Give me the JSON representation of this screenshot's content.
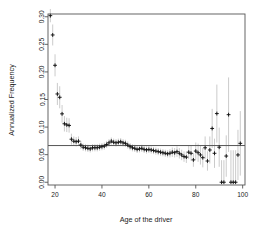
{
  "chart_data": {
    "type": "scatter",
    "title": "",
    "xlabel": "Age of the driver",
    "ylabel": "Annualized Frequency",
    "xlim": [
      17,
      101
    ],
    "ylim": [
      -0.005,
      0.305
    ],
    "xticks": [
      20,
      40,
      60,
      80,
      100
    ],
    "xtick_labels": [
      "20",
      "40",
      "60",
      "80",
      "100"
    ],
    "yticks": [
      0.0,
      0.05,
      0.1,
      0.15,
      0.2,
      0.25,
      0.3
    ],
    "ytick_labels": [
      "0.00",
      "0.05",
      "0.10",
      "0.15",
      "0.20",
      "0.25",
      "0.30"
    ],
    "grid": false,
    "legend": null,
    "marker": "plus",
    "marker_color": "#111111",
    "errorbar_color": "#b4b4b4",
    "reference_line": {
      "orientation": "horizontal",
      "y": 0.0665,
      "color": "#555555",
      "label": "overall mean annualized frequency"
    },
    "x": [
      18,
      19,
      20,
      21,
      22,
      23,
      24,
      25,
      26,
      27,
      28,
      29,
      30,
      31,
      32,
      33,
      34,
      35,
      36,
      37,
      38,
      39,
      40,
      41,
      42,
      43,
      44,
      45,
      46,
      47,
      48,
      49,
      50,
      51,
      52,
      53,
      54,
      55,
      56,
      57,
      58,
      59,
      60,
      61,
      62,
      63,
      64,
      65,
      66,
      67,
      68,
      69,
      70,
      71,
      72,
      73,
      74,
      75,
      76,
      77,
      78,
      79,
      80,
      81,
      82,
      83,
      84,
      85,
      86,
      87,
      88,
      89,
      90,
      91,
      92,
      93,
      94,
      95,
      96,
      97,
      98,
      99
    ],
    "y": [
      0.302,
      0.267,
      0.212,
      0.16,
      0.154,
      0.124,
      0.106,
      0.104,
      0.103,
      0.078,
      0.0745,
      0.0735,
      0.0745,
      0.0675,
      0.0635,
      0.0625,
      0.0615,
      0.0605,
      0.0625,
      0.0625,
      0.0625,
      0.0635,
      0.0645,
      0.0655,
      0.0685,
      0.0715,
      0.0745,
      0.0725,
      0.0715,
      0.0725,
      0.0735,
      0.0715,
      0.0705,
      0.0675,
      0.0645,
      0.0625,
      0.0615,
      0.0595,
      0.0605,
      0.0615,
      0.0595,
      0.0585,
      0.0595,
      0.0585,
      0.0575,
      0.0565,
      0.0555,
      0.0545,
      0.0535,
      0.0525,
      0.0515,
      0.0525,
      0.0545,
      0.0535,
      0.0555,
      0.0525,
      0.0495,
      0.0465,
      0.0455,
      0.0545,
      0.0525,
      0.0405,
      0.0565,
      0.0535,
      0.0495,
      0.0445,
      0.0625,
      0.0385,
      0.0585,
      0.0975,
      0.0525,
      0.1245,
      0.0635,
      0.0,
      0.0,
      0.0475,
      0.1225,
      0.0,
      0.0,
      0.0,
      0.0495,
      0.0705
    ],
    "yerr_low": [
      0.29,
      0.248,
      0.192,
      0.14,
      0.134,
      0.108,
      0.092,
      0.091,
      0.09,
      0.068,
      0.066,
      0.065,
      0.066,
      0.06,
      0.057,
      0.056,
      0.055,
      0.054,
      0.056,
      0.056,
      0.056,
      0.057,
      0.058,
      0.059,
      0.062,
      0.065,
      0.068,
      0.066,
      0.065,
      0.066,
      0.067,
      0.065,
      0.064,
      0.061,
      0.058,
      0.056,
      0.055,
      0.053,
      0.054,
      0.055,
      0.053,
      0.052,
      0.053,
      0.052,
      0.051,
      0.05,
      0.049,
      0.048,
      0.047,
      0.046,
      0.045,
      0.045,
      0.046,
      0.045,
      0.046,
      0.043,
      0.04,
      0.037,
      0.035,
      0.042,
      0.039,
      0.028,
      0.041,
      0.037,
      0.032,
      0.027,
      0.042,
      0.021,
      0.034,
      0.062,
      0.026,
      0.072,
      0.028,
      0.0,
      0.0,
      0.01,
      0.055,
      0.0,
      0.0,
      0.0,
      0.004,
      0.012
    ],
    "yerr_high": [
      0.314,
      0.286,
      0.232,
      0.18,
      0.174,
      0.14,
      0.12,
      0.117,
      0.116,
      0.088,
      0.083,
      0.082,
      0.083,
      0.075,
      0.07,
      0.069,
      0.068,
      0.067,
      0.069,
      0.069,
      0.069,
      0.07,
      0.071,
      0.072,
      0.075,
      0.078,
      0.081,
      0.079,
      0.078,
      0.079,
      0.08,
      0.078,
      0.077,
      0.074,
      0.071,
      0.069,
      0.068,
      0.066,
      0.067,
      0.068,
      0.066,
      0.065,
      0.066,
      0.065,
      0.064,
      0.063,
      0.062,
      0.061,
      0.06,
      0.059,
      0.058,
      0.06,
      0.063,
      0.062,
      0.065,
      0.062,
      0.059,
      0.056,
      0.056,
      0.067,
      0.066,
      0.053,
      0.072,
      0.07,
      0.067,
      0.062,
      0.083,
      0.056,
      0.083,
      0.133,
      0.079,
      0.177,
      0.099,
      0.04,
      0.04,
      0.085,
      0.19,
      0.058,
      0.058,
      0.058,
      0.095,
      0.129
    ]
  },
  "figure": {
    "background": "#ffffff",
    "frame_color": "#555555",
    "axis_label_color": "#1a1a1a"
  }
}
